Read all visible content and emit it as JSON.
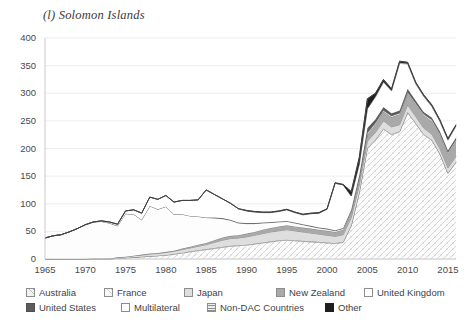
{
  "title": "(l) Solomon Islands",
  "axes": {
    "y_ticks": [
      "400",
      "350",
      "300",
      "250",
      "200",
      "150",
      "100",
      "50",
      "0"
    ],
    "x_ticks": [
      "1965",
      "1970",
      "1975",
      "1980",
      "1985",
      "1990",
      "1995",
      "2000",
      "2005",
      "2010",
      "2015"
    ]
  },
  "legend": {
    "rows": [
      [
        {
          "label": "Australia",
          "pattern": "diag-dots",
          "fill": "#f2f2f2"
        },
        {
          "label": "France",
          "pattern": "sparse-dots",
          "fill": "#f7f7f7"
        },
        {
          "label": "Japan",
          "pattern": "light-grey",
          "fill": "#dedede"
        },
        {
          "label": "New Zealand",
          "pattern": "mid-grey",
          "fill": "#a6a6a6"
        },
        {
          "label": "United Kingdom",
          "pattern": "white",
          "fill": "#ffffff"
        }
      ],
      [
        {
          "label": "United States",
          "pattern": "dark-grey",
          "fill": "#595959"
        },
        {
          "label": "Multilateral",
          "pattern": "white",
          "fill": "#ffffff"
        },
        {
          "label": "Non-DAC Countries",
          "pattern": "horizontal-lines",
          "fill": "#ededed"
        },
        {
          "label": "Other",
          "pattern": "black",
          "fill": "#1a1a1a"
        }
      ]
    ]
  },
  "chart_data": {
    "type": "area",
    "stacked": true,
    "title": "(l) Solomon Islands",
    "xlabel": "",
    "ylabel": "",
    "ylim": [
      0,
      400
    ],
    "xlim": [
      1965,
      2016
    ],
    "grid": "horizontal",
    "legend_position": "bottom",
    "x": [
      1965,
      1966,
      1967,
      1968,
      1969,
      1970,
      1971,
      1972,
      1973,
      1974,
      1975,
      1976,
      1977,
      1978,
      1979,
      1980,
      1981,
      1982,
      1983,
      1984,
      1985,
      1986,
      1987,
      1988,
      1989,
      1990,
      1991,
      1992,
      1993,
      1994,
      1995,
      1996,
      1997,
      1998,
      1999,
      2000,
      2001,
      2002,
      2003,
      2004,
      2005,
      2006,
      2007,
      2008,
      2009,
      2010,
      2011,
      2012,
      2013,
      2014,
      2015,
      2016
    ],
    "series": [
      {
        "name": "Australia",
        "values": [
          0,
          0,
          0,
          0,
          0,
          0,
          0,
          0,
          0,
          1,
          2,
          3,
          4,
          5,
          6,
          7,
          9,
          11,
          13,
          15,
          17,
          19,
          21,
          23,
          24,
          25,
          27,
          29,
          31,
          33,
          34,
          33,
          32,
          31,
          30,
          29,
          28,
          30,
          60,
          120,
          200,
          215,
          235,
          225,
          230,
          265,
          245,
          225,
          215,
          190,
          155,
          175
        ]
      },
      {
        "name": "France",
        "values": [
          0,
          0,
          0,
          0,
          0,
          0,
          0,
          0,
          0,
          0,
          0,
          0,
          0,
          0,
          0,
          0,
          0,
          0,
          1,
          1,
          1,
          1,
          1,
          1,
          1,
          1,
          1,
          1,
          1,
          1,
          1,
          1,
          1,
          1,
          1,
          1,
          1,
          1,
          1,
          1,
          1,
          1,
          1,
          1,
          1,
          1,
          1,
          1,
          1,
          1,
          1,
          1
        ]
      },
      {
        "name": "Japan",
        "values": [
          0,
          0,
          0,
          0,
          0,
          0,
          1,
          1,
          1,
          2,
          2,
          3,
          3,
          4,
          4,
          5,
          5,
          6,
          6,
          7,
          8,
          10,
          12,
          13,
          13,
          14,
          15,
          16,
          17,
          17,
          18,
          17,
          16,
          15,
          14,
          13,
          12,
          13,
          14,
          13,
          12,
          13,
          14,
          13,
          12,
          13,
          12,
          11,
          10,
          9,
          9,
          10
        ]
      },
      {
        "name": "New Zealand",
        "values": [
          0,
          0,
          0,
          0,
          0,
          0,
          0,
          0,
          0,
          0,
          0,
          0,
          1,
          1,
          1,
          1,
          1,
          2,
          2,
          3,
          3,
          4,
          5,
          5,
          5,
          6,
          6,
          7,
          7,
          8,
          8,
          8,
          8,
          8,
          8,
          8,
          8,
          9,
          10,
          11,
          13,
          15,
          17,
          18,
          19,
          21,
          22,
          23,
          24,
          25,
          26,
          28
        ]
      },
      {
        "name": "United Kingdom",
        "values": [
          38,
          42,
          44,
          49,
          55,
          62,
          66,
          67,
          64,
          57,
          78,
          75,
          63,
          86,
          79,
          82,
          66,
          62,
          56,
          51,
          46,
          40,
          34,
          28,
          22,
          18,
          15,
          12,
          10,
          8,
          7,
          6,
          5,
          4,
          3,
          3,
          2,
          2,
          2,
          2,
          2,
          2,
          2,
          2,
          2,
          2,
          2,
          2,
          2,
          2,
          2,
          2
        ]
      },
      {
        "name": "United States",
        "values": [
          0,
          0,
          0,
          0,
          0,
          0,
          0,
          0,
          0,
          0,
          0,
          0,
          0,
          0,
          0,
          0,
          0,
          0,
          0,
          0,
          0,
          1,
          1,
          1,
          1,
          1,
          1,
          1,
          1,
          1,
          1,
          1,
          1,
          1,
          1,
          1,
          1,
          1,
          2,
          5,
          9,
          7,
          6,
          5,
          5,
          6,
          5,
          4,
          4,
          4,
          4,
          4
        ]
      },
      {
        "name": "Multilateral",
        "values": [
          0,
          0,
          0,
          0,
          0,
          0,
          0,
          1,
          2,
          3,
          5,
          8,
          12,
          16,
          18,
          20,
          22,
          25,
          28,
          30,
          50,
          42,
          35,
          30,
          25,
          22,
          20,
          18,
          17,
          18,
          20,
          18,
          17,
          22,
          26,
          35,
          85,
          78,
          25,
          20,
          35,
          40,
          45,
          40,
          85,
          45,
          30,
          28,
          20,
          18,
          18,
          20
        ]
      },
      {
        "name": "Non-DAC Countries",
        "values": [
          0,
          0,
          0,
          0,
          0,
          0,
          0,
          0,
          0,
          0,
          0,
          0,
          0,
          0,
          0,
          0,
          0,
          0,
          0,
          0,
          0,
          0,
          0,
          0,
          0,
          0,
          0,
          0,
          0,
          0,
          0,
          0,
          0,
          0,
          0,
          0,
          0,
          0,
          0,
          0,
          0,
          1,
          1,
          1,
          1,
          1,
          1,
          1,
          1,
          1,
          1,
          1
        ]
      },
      {
        "name": "Other",
        "values": [
          0,
          0,
          0,
          0,
          0,
          0,
          0,
          0,
          0,
          0,
          0,
          0,
          0,
          0,
          0,
          0,
          0,
          0,
          0,
          0,
          0,
          0,
          0,
          0,
          0,
          1,
          1,
          1,
          1,
          1,
          1,
          1,
          1,
          1,
          1,
          1,
          1,
          1,
          8,
          12,
          18,
          6,
          4,
          3,
          3,
          2,
          2,
          2,
          2,
          2,
          2,
          2
        ]
      }
    ]
  }
}
